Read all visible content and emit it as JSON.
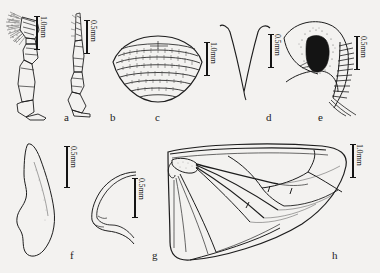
{
  "figure": {
    "kind": "scientific-plate",
    "background_color": "#f3f2f0",
    "ink_color": "#1d1d1d",
    "panel_count": 8
  },
  "panels": [
    {
      "letter": "a",
      "subject": "maxillary-palp-with-apical-setae",
      "scale": {
        "label": "1.0mm",
        "value": 1.0,
        "unit": "mm"
      }
    },
    {
      "letter": "b",
      "subject": "slender-segmented-palp",
      "scale": {
        "label": "0.5mm",
        "value": 0.5,
        "unit": "mm"
      }
    },
    {
      "letter": "c",
      "subject": "striated-ovoid-body",
      "scale": {
        "label": "",
        "value": null,
        "unit": ""
      }
    },
    {
      "letter": "d",
      "subject": "v-shaped-sclerite",
      "scale": {
        "label": "1.0mm",
        "value": 1.0,
        "unit": "mm"
      },
      "scale_right": {
        "label": "0.5mm",
        "value": 0.5,
        "unit": "mm"
      }
    },
    {
      "letter": "e",
      "subject": "genital-plate-with-spine-comb",
      "scale": {
        "label": "0.5mm",
        "value": 0.5,
        "unit": "mm"
      }
    },
    {
      "letter": "f",
      "subject": "elongate-tapering-blade",
      "scale": {
        "label": "0.5mm",
        "value": 0.5,
        "unit": "mm"
      }
    },
    {
      "letter": "g",
      "subject": "crescent-hook-sclerite",
      "scale": {
        "label": "0.5mm",
        "value": 0.5,
        "unit": "mm"
      }
    },
    {
      "letter": "h",
      "subject": "forewing-venation",
      "scale": {
        "label": "1.0mm",
        "value": 1.0,
        "unit": "mm"
      }
    }
  ]
}
